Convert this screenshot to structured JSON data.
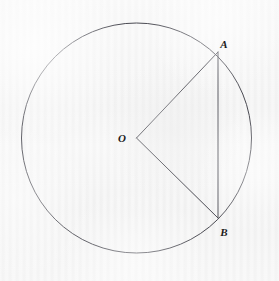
{
  "figure": {
    "kind": "circle-geometry-diagram",
    "background_color": "#f2f2f2",
    "stroke_color": "#4a4a52",
    "label_color": "#1c1c1c",
    "canvas": {
      "width": 279,
      "height": 281
    },
    "circle": {
      "name": "circle",
      "center": {
        "x": 136.5,
        "y": 138
      },
      "radius": 115,
      "stroke_width": 1.0,
      "fill": "none"
    },
    "points": [
      {
        "id": "O",
        "label": "O",
        "x": 136.5,
        "y": 138,
        "label_x": 122,
        "label_y": 138,
        "role": "center"
      },
      {
        "id": "A",
        "label": "A",
        "x": 218,
        "y": 52,
        "label_x": 224,
        "label_y": 44,
        "role": "on-circle"
      },
      {
        "id": "B",
        "label": "B",
        "x": 218,
        "y": 218,
        "label_x": 224,
        "label_y": 232,
        "role": "on-circle"
      }
    ],
    "segments": [
      {
        "id": "OA",
        "from": "O",
        "to": "A",
        "kind": "radius",
        "stroke_width": 1.0
      },
      {
        "id": "OB",
        "from": "O",
        "to": "B",
        "kind": "radius",
        "stroke_width": 1.0
      },
      {
        "id": "AB",
        "from": "A",
        "to": "B",
        "kind": "chord",
        "stroke_width": 1.0
      }
    ]
  }
}
